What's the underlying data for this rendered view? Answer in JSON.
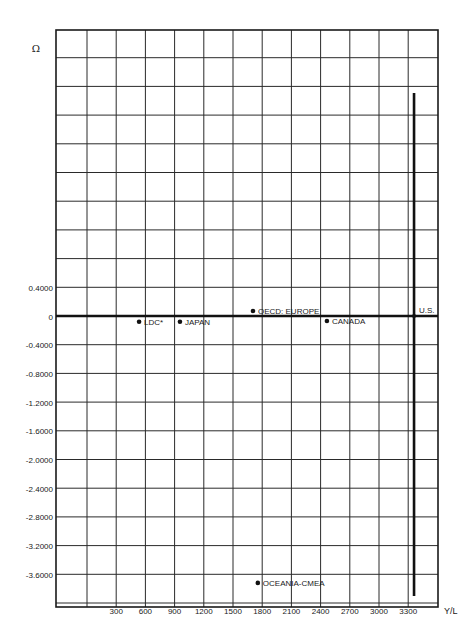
{
  "page": {
    "number": "98"
  },
  "chart_data": {
    "type": "scatter",
    "title": "",
    "xlabel": "Y/L",
    "ylabel": "Ω",
    "x_ticks": [
      300,
      600,
      900,
      1200,
      1500,
      1800,
      2100,
      2400,
      2700,
      3000,
      3300
    ],
    "x_tick_labels": [
      "300",
      "600",
      "900",
      "1200",
      "1500",
      "1800",
      "2100",
      "2400",
      "2700",
      "3000",
      "3300"
    ],
    "y_ticks": [
      0.4,
      0,
      -0.4,
      -0.8,
      -1.2,
      -1.6,
      -2.0,
      -2.4,
      -2.8,
      -3.2,
      -3.6
    ],
    "y_tick_labels": [
      "0.4000",
      "0",
      "-0.4000",
      "-0.8000",
      "-1.2000",
      "-1.6000",
      "-2.0000",
      "-2.4000",
      "-2.8000",
      "-3.2000",
      "-3.6000"
    ],
    "xlim": [
      -300,
      3600
    ],
    "ylim": [
      -4.0,
      4.0
    ],
    "grid": true,
    "points": [
      {
        "label": "LDC*",
        "x": 535,
        "y": -0.08
      },
      {
        "label": "JAPAN",
        "x": 955,
        "y": -0.08
      },
      {
        "label": "OECD: EUROPE",
        "x": 1705,
        "y": 0.07
      },
      {
        "label": "CANADA",
        "x": 2465,
        "y": -0.07
      },
      {
        "label": "U.S.",
        "x": 3360,
        "y": 0.0
      },
      {
        "label": "OCEANIA-CMEA",
        "x": 1755,
        "y": -3.72
      }
    ],
    "reference_lines": [
      {
        "orientation": "horizontal",
        "value": 0,
        "style": "thick"
      },
      {
        "orientation": "vertical",
        "value": 3360,
        "from": -3.8,
        "to": 3.5,
        "style": "thick"
      }
    ]
  }
}
